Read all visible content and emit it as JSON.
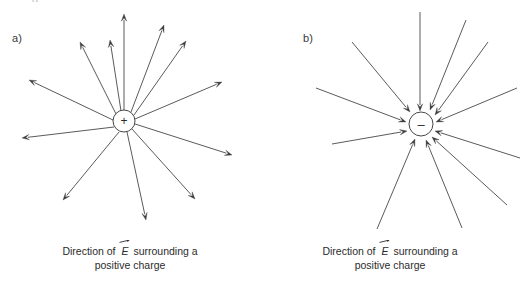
{
  "figure": {
    "stroke_color": "#3c3c3c",
    "text_color": "#2b2b2b",
    "background": "#ffffff",
    "partial_top_glyph": "g"
  },
  "panels": [
    {
      "id": "a",
      "label": "a)",
      "charge": {
        "sign": "+",
        "name": "positive-charge",
        "cx": 124,
        "cy": 121,
        "r": 11
      },
      "field_direction": "outward",
      "arrow_count": 12,
      "arrows": [
        {
          "x1": 124,
          "y1": 110,
          "x2": 124,
          "y2": 14
        },
        {
          "x1": 131,
          "y1": 112,
          "x2": 164,
          "y2": 25
        },
        {
          "x1": 134,
          "y1": 115,
          "x2": 186,
          "y2": 41
        },
        {
          "x1": 135,
          "y1": 119,
          "x2": 222,
          "y2": 82
        },
        {
          "x1": 135,
          "y1": 124,
          "x2": 232,
          "y2": 155
        },
        {
          "x1": 132,
          "y1": 129,
          "x2": 195,
          "y2": 199
        },
        {
          "x1": 127,
          "y1": 132,
          "x2": 146,
          "y2": 220
        },
        {
          "x1": 119,
          "y1": 132,
          "x2": 63,
          "y2": 200
        },
        {
          "x1": 114,
          "y1": 127,
          "x2": 22,
          "y2": 138
        },
        {
          "x1": 113,
          "y1": 120,
          "x2": 29,
          "y2": 80
        },
        {
          "x1": 116,
          "y1": 114,
          "x2": 80,
          "y2": 42
        },
        {
          "x1": 121,
          "y1": 111,
          "x2": 110,
          "y2": 40
        }
      ],
      "caption_line1": "Direction of",
      "caption_symbol": "E",
      "caption_line1_tail": "surrounding a",
      "caption_line2": "positive charge"
    },
    {
      "id": "b",
      "label": "b)",
      "charge": {
        "sign": "–",
        "name": "negative-charge",
        "cx": 161,
        "cy": 124,
        "r": 12
      },
      "field_direction": "inward",
      "arrow_count": 11,
      "arrows": [
        {
          "x1": 160,
          "y1": 12,
          "x2": 160,
          "y2": 111
        },
        {
          "x1": 206,
          "y1": 20,
          "x2": 170,
          "y2": 110
        },
        {
          "x1": 228,
          "y1": 42,
          "x2": 175,
          "y2": 115
        },
        {
          "x1": 257,
          "y1": 88,
          "x2": 176,
          "y2": 122
        },
        {
          "x1": 260,
          "y1": 158,
          "x2": 175,
          "y2": 131
        },
        {
          "x1": 247,
          "y1": 205,
          "x2": 172,
          "y2": 137
        },
        {
          "x1": 202,
          "y1": 228,
          "x2": 166,
          "y2": 140
        },
        {
          "x1": 117,
          "y1": 229,
          "x2": 155,
          "y2": 139
        },
        {
          "x1": 72,
          "y1": 144,
          "x2": 147,
          "y2": 131
        },
        {
          "x1": 56,
          "y1": 88,
          "x2": 146,
          "y2": 122
        },
        {
          "x1": 92,
          "y1": 42,
          "x2": 150,
          "y2": 112
        }
      ],
      "caption_line1": "Direction of",
      "caption_symbol": "E",
      "caption_line1_tail": "surrounding a",
      "caption_line2": "positive charge"
    }
  ]
}
